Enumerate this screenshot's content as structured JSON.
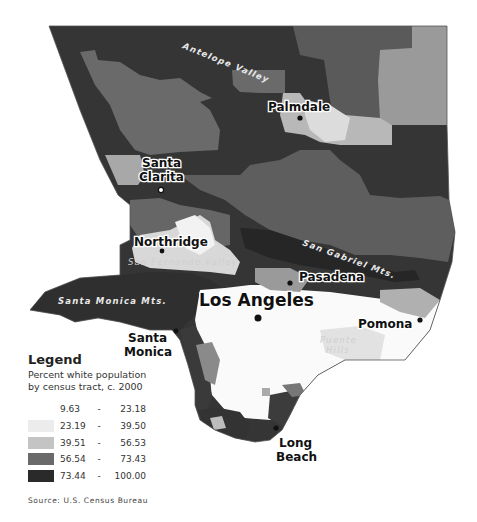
{
  "map": {
    "title": "Percent white population by census tract, Los Angeles County",
    "cities": [
      {
        "name": "Los Angeles",
        "x": 258,
        "y": 318
      },
      {
        "name": "Palmdale",
        "x": 300,
        "y": 118
      },
      {
        "name": "Santa Clarita",
        "x": 162,
        "y": 190
      },
      {
        "name": "Northridge",
        "x": 162,
        "y": 250
      },
      {
        "name": "Pasadena",
        "x": 290,
        "y": 282
      },
      {
        "name": "Pomona",
        "x": 419,
        "y": 319
      },
      {
        "name": "Santa Monica",
        "x": 176,
        "y": 330
      },
      {
        "name": "Long Beach",
        "x": 275,
        "y": 428
      }
    ],
    "labels": {
      "los_angeles": "Los Angeles",
      "palmdale": "Palmdale",
      "santa_clarita_1": "Santa",
      "santa_clarita_2": "Clarita",
      "northridge": "Northridge",
      "pasadena": "Pasadena",
      "pomona": "Pomona",
      "santa_monica_1": "Santa",
      "santa_monica_2": "Monica",
      "long_beach_1": "Long",
      "long_beach_2": "Beach"
    },
    "features": {
      "antelope_valley": "Antelope Valley",
      "san_fernando_valley": "San Fernando Valley",
      "san_gabriel_mts": "San Gabriel Mts.",
      "santa_monica_mts": "Santa Monica Mts.",
      "puente_hills_1": "Puente",
      "puente_hills_2": "Hills"
    },
    "colors": {
      "class1": "#ffffff",
      "class2": "#e6e6e6",
      "class3": "#bdbdbd",
      "class4": "#6e6e6e",
      "class5": "#2e2e2e"
    }
  },
  "legend": {
    "title": "Legend",
    "subtitle_1": "Percent white population",
    "subtitle_2": "by census tract, c. 2000",
    "classes": [
      {
        "low": "9.63",
        "sep": "-",
        "high": "23.18",
        "color": "#ffffff"
      },
      {
        "low": "23.19",
        "sep": "-",
        "high": "39.50",
        "color": "#ececec"
      },
      {
        "low": "39.51",
        "sep": "-",
        "high": "56.53",
        "color": "#c4c4c4"
      },
      {
        "low": "56.54",
        "sep": "-",
        "high": "73.43",
        "color": "#6a6a6a"
      },
      {
        "low": "73.44",
        "sep": "-",
        "high": "100.00",
        "color": "#2a2a2a"
      }
    ]
  },
  "source": "Source: U.S. Census Bureau"
}
